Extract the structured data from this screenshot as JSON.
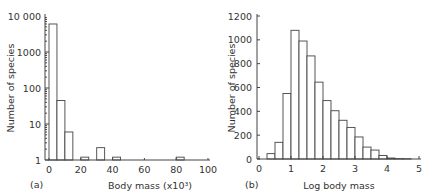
{
  "chart_data": [
    {
      "type": "bar",
      "panel_label": "(a)",
      "xlabel": "Body mass (x10³)",
      "ylabel": "Number of species",
      "yscale": "log",
      "ylim": [
        1,
        10000
      ],
      "yticks": [
        "1",
        "10",
        "100",
        "1000",
        "10 000"
      ],
      "xlim": [
        0,
        100
      ],
      "xticks": [
        "0",
        "20",
        "40",
        "60",
        "80",
        "100"
      ],
      "bins": [
        {
          "from": 0,
          "to": 5,
          "value": 6000
        },
        {
          "from": 5,
          "to": 10,
          "value": 45
        },
        {
          "from": 10,
          "to": 15,
          "value": 6
        },
        {
          "from": 20,
          "to": 25,
          "value": 1.2
        },
        {
          "from": 30,
          "to": 35,
          "value": 2.2
        },
        {
          "from": 40,
          "to": 45,
          "value": 1.2
        },
        {
          "from": 80,
          "to": 85,
          "value": 1.2
        }
      ]
    },
    {
      "type": "bar",
      "panel_label": "(b)",
      "xlabel": "Log body mass",
      "ylabel": "Number of species",
      "ylim": [
        0,
        1200
      ],
      "yticks": [
        "0",
        "200",
        "400",
        "600",
        "800",
        "1000",
        "1200"
      ],
      "xlim": [
        0,
        5
      ],
      "xticks": [
        "0",
        "1",
        "2",
        "3",
        "4",
        "5"
      ],
      "bin_width": 0.25,
      "bins": [
        {
          "from": 0.25,
          "value": 45
        },
        {
          "from": 0.5,
          "value": 140
        },
        {
          "from": 0.75,
          "value": 550
        },
        {
          "from": 1.0,
          "value": 1080
        },
        {
          "from": 1.25,
          "value": 990
        },
        {
          "from": 1.5,
          "value": 865
        },
        {
          "from": 1.75,
          "value": 645
        },
        {
          "from": 2.0,
          "value": 490
        },
        {
          "from": 2.25,
          "value": 405
        },
        {
          "from": 2.5,
          "value": 325
        },
        {
          "from": 2.75,
          "value": 265
        },
        {
          "from": 3.0,
          "value": 185
        },
        {
          "from": 3.25,
          "value": 100
        },
        {
          "from": 3.5,
          "value": 75
        },
        {
          "from": 3.75,
          "value": 30
        },
        {
          "from": 4.0,
          "value": 8
        },
        {
          "from": 4.25,
          "value": 3
        },
        {
          "from": 4.5,
          "value": 2
        }
      ]
    }
  ]
}
